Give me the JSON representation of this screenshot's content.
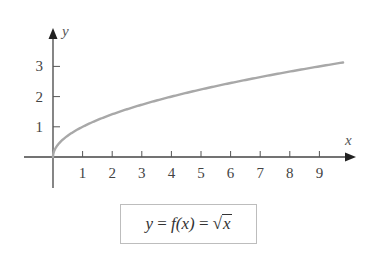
{
  "chart_data": {
    "type": "line",
    "title": "",
    "xlabel": "x",
    "ylabel": "y",
    "x_ticks": [
      1,
      2,
      3,
      4,
      5,
      6,
      7,
      8,
      9
    ],
    "y_ticks": [
      1,
      2,
      3
    ],
    "xlim": [
      -0.95,
      10.3
    ],
    "ylim": [
      -0.6,
      4.3
    ],
    "grid": false,
    "legend": "none",
    "series": [
      {
        "name": "y = f(x) = √x",
        "color": "#a8a8a8",
        "x": [
          0,
          0.05,
          0.1,
          0.25,
          0.5,
          1,
          2,
          3,
          4,
          5,
          6,
          7,
          8,
          9,
          9.8
        ],
        "y": [
          0,
          0.224,
          0.316,
          0.5,
          0.707,
          1,
          1.414,
          1.732,
          2,
          2.236,
          2.449,
          2.646,
          2.828,
          3,
          3.13
        ]
      }
    ],
    "annotations": [
      {
        "text": "y = f(x) = √x",
        "position": "below-chart-boxed"
      }
    ]
  },
  "axes": {
    "x_label": "x",
    "y_label": "y",
    "x_tick_labels": [
      "1",
      "2",
      "3",
      "4",
      "5",
      "6",
      "7",
      "8",
      "9"
    ],
    "y_tick_labels": [
      "1",
      "2",
      "3"
    ]
  },
  "formula": {
    "lhs": "y",
    "eq1": " = ",
    "func": "f",
    "arg": "(x)",
    "eq2": " = ",
    "radical": "√",
    "radicand": "x"
  }
}
